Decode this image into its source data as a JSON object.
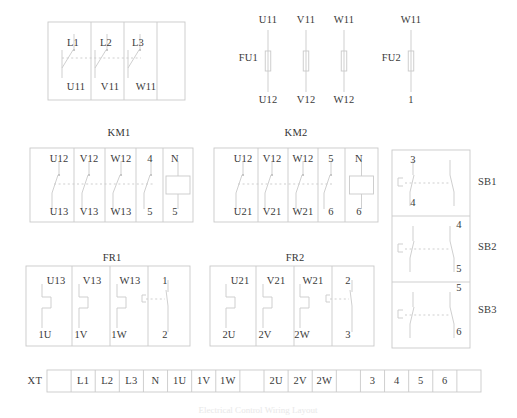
{
  "diagram": {
    "title": "Electrical Control Wiring Layout",
    "line_color": "#c9c9c9",
    "text_color": "#3a3a3a",
    "background": "#ffffff"
  },
  "disconnect_switch": {
    "name": "QS",
    "poles": 3,
    "top_terminals": [
      "L1",
      "L2",
      "L3"
    ],
    "bottom_terminals": [
      "U11",
      "V11",
      "W11"
    ]
  },
  "fuses": {
    "fu1": {
      "label": "FU1",
      "poles": 3,
      "top_terminals": [
        "U11",
        "V11",
        "W11"
      ],
      "bottom_terminals": [
        "U12",
        "V12",
        "W12"
      ]
    },
    "fu2": {
      "label": "FU2",
      "poles": 1,
      "top_terminals": [
        "W11"
      ],
      "bottom_terminals": [
        "1"
      ]
    }
  },
  "contactors": [
    {
      "label": "KM1",
      "top_terminals": [
        "U12",
        "V12",
        "W12",
        "4",
        "N"
      ],
      "bottom_terminals": [
        "U13",
        "V13",
        "W13",
        "5",
        "5"
      ],
      "coil_column_index": 4
    },
    {
      "label": "KM2",
      "top_terminals": [
        "U12",
        "V12",
        "W12",
        "5",
        "N"
      ],
      "bottom_terminals": [
        "U21",
        "V21",
        "W21",
        "6",
        "6"
      ],
      "coil_column_index": 4
    }
  ],
  "overloads": [
    {
      "label": "FR1",
      "top_terminals": [
        "U13",
        "V13",
        "W13",
        "1"
      ],
      "bottom_terminals": [
        "1U",
        "1V",
        "1W",
        "2"
      ],
      "contact_column_index": 3
    },
    {
      "label": "FR2",
      "top_terminals": [
        "U21",
        "V21",
        "W21",
        "2"
      ],
      "bottom_terminals": [
        "2U",
        "2V",
        "2W",
        "3"
      ],
      "contact_column_index": 3
    }
  ],
  "pushbuttons": [
    {
      "label": "SB1",
      "top_terminal": "3",
      "bottom_terminal": "4",
      "terminal_side": "left"
    },
    {
      "label": "SB2",
      "top_terminal": "4",
      "bottom_terminal": "5",
      "terminal_side": "right"
    },
    {
      "label": "SB3",
      "top_terminal": "5",
      "bottom_terminal": "6",
      "terminal_side": "right"
    }
  ],
  "terminal_strip": {
    "label": "XT",
    "terminals": [
      "",
      "L1",
      "L2",
      "L3",
      "N",
      "1U",
      "1V",
      "1W",
      "",
      "2U",
      "2V",
      "2W",
      "",
      "3",
      "4",
      "5",
      "6",
      ""
    ]
  }
}
